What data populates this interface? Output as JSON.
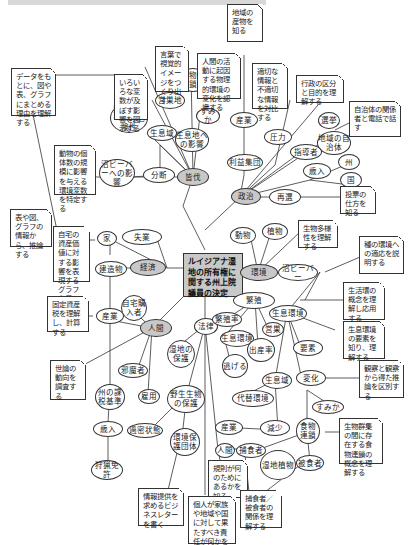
{
  "center": {
    "label": "ルイジアナ湿地の所有権に関する州上院議員の決定"
  },
  "hubs": {
    "livelihood": "皆伐",
    "politics": "政治",
    "environment": "環境",
    "economy": "経済",
    "human": "人間",
    "law": "法律"
  },
  "ellipses": {
    "food_chain_top": "食物連鎖",
    "pasture": "営巣地",
    "habitat_small": "すみか",
    "beaver_risk": "沼ビーバーへの危険性",
    "habitat_area": "生息域",
    "habitat_effect": "生息地への影響",
    "beaver_effect": "沼ビーバーへの影響",
    "fragmentation": "分断",
    "industry_top": "産業",
    "pressure": "圧力",
    "interest_group": "利益集団",
    "election": "選挙",
    "local_gov": "地域の自治体",
    "leader": "指導者",
    "state": "州",
    "revenue_top": "歳入",
    "nation": "国",
    "reelection": "再選",
    "animals": "動物",
    "plants": "植物",
    "beaver": "沼ビーバー",
    "house": "家",
    "unemployment": "失業",
    "buildings": "建造物",
    "industry_left": "産業",
    "home_buyer": "自宅購入者",
    "breeding": "繁殖",
    "breeding_rate": "繁殖率",
    "habitat_env": "生息環境",
    "nesting": "営巣",
    "habitat_env2": "生息環境",
    "birth_rate": "出産率",
    "elements": "要素",
    "escape": "逃げる",
    "wetland_protect": "湿地の保護",
    "obstacle": "邪魔者",
    "state_tax": "州の課税基準",
    "employment": "雇用",
    "wildlife_protect": "野生生物の保護",
    "habitat_zone": "生息域",
    "change": "変化",
    "alt_env": "代替環境",
    "habitat_bottom": "すみか",
    "revenue_left": "歳入",
    "overcrowd": "過密状態",
    "env_group": "環境保護団体",
    "hunting_license": "狩猟免許",
    "industry_bottom": "産業",
    "decrease": "減少",
    "food_chain": "食物連鎖",
    "human_small": "人間",
    "predator": "捕食者",
    "wetland_plants": "湿地植物",
    "prey": "被食者"
  },
  "notes": {
    "local_products": "地域の産物を知る",
    "visual_image": "言葉で視覚的イメージをつくり出す",
    "human_activity": "人間の活動に起因する物理的環境の変化を認識する",
    "data_graph": "データをもとに、図や表、グラフにまとめる理由を理解する",
    "variables": "いろいろな変数が及ぼす影響を図示する",
    "appropriate_info": "適切な情報と不適切な情報を対比する",
    "admin_division": "行政の区分と目的を理解する",
    "phone_talk": "自治体の関係者と電話で話す",
    "animal_count": "動物の個体数の規模に影響を与える環境変数を特定する",
    "voting": "投票の仕方を知る",
    "biodiversity": "生物多様性を理解する",
    "adaptation": "種の環境への適応を説明する",
    "inference": "表や図、グラフの情報から、推論する",
    "home_value": "自宅の資産価値に対する影響を表現するグラフを用いる",
    "property_tax": "固定資産税を理解し、計算する",
    "life_cycle": "生活環の概念を理解し応用する",
    "habitat_elements": "生息環境の要素を知り、理解する",
    "public_opinion": "世論の動向を調査する",
    "observation": "観察と観察から得た推論を区別する",
    "business_letter": "情報提供を求めるビジネスレターを書く",
    "rules_purpose": "規則が何のためにあるかを知る",
    "food_web": "生物群集の間に存在する食物連鎖の概念を理解する",
    "responsibility": "個人が家族や地域や国に対して果たすべき責任が何かを知る",
    "predator_prey": "捕食者／被食者の関係を理解する"
  }
}
